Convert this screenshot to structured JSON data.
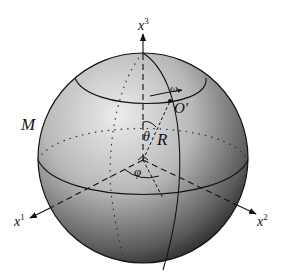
{
  "figure": {
    "manifold_label": "M",
    "axes": [
      {
        "name": "x",
        "index": "3"
      },
      {
        "name": "x",
        "index": "1"
      },
      {
        "name": "x",
        "index": "2"
      }
    ],
    "point_label": "O′",
    "radius_label": "R",
    "polar_angle_label": "θ",
    "azimuth_angle_label": "φ",
    "angular_velocity_label": "ω",
    "colors": {
      "sphere_light": "#e6e6e6",
      "sphere_dark": "#1a1a1a",
      "line": "#111111"
    }
  }
}
